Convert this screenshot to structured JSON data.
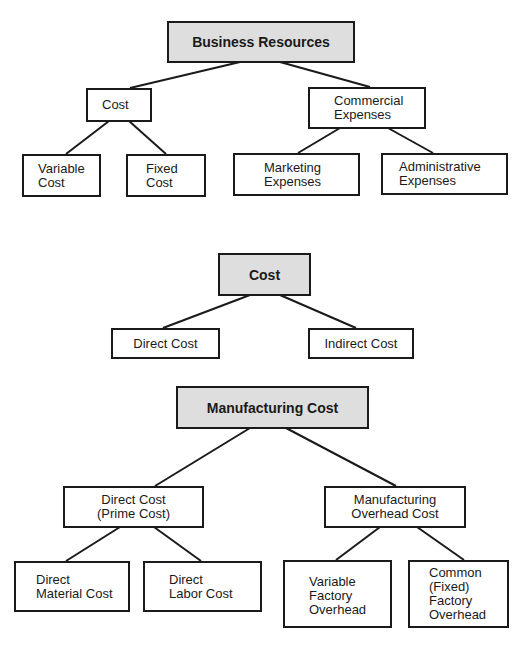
{
  "diagram1": {
    "root": "Business Resources",
    "cost": "Cost",
    "commercial": [
      "Commercial",
      "Expenses"
    ],
    "variable_cost": [
      "Variable",
      "Cost"
    ],
    "fixed_cost": [
      "Fixed",
      "Cost"
    ],
    "marketing": [
      "Marketing",
      "Expenses"
    ],
    "administrative": [
      "Administrative",
      "Expenses"
    ]
  },
  "diagram2": {
    "root": "Cost",
    "direct": "Direct Cost",
    "indirect": "Indirect Cost"
  },
  "diagram3": {
    "root": "Manufacturing Cost",
    "prime": [
      "Direct Cost",
      "(Prime Cost)"
    ],
    "overhead": [
      "Manufacturing",
      "Overhead Cost"
    ],
    "material": [
      "Direct",
      "Material Cost"
    ],
    "labor": [
      "Direct",
      "Labor Cost"
    ],
    "variable_overhead": [
      "Variable",
      "Factory",
      "Overhead"
    ],
    "common_overhead": [
      "Common",
      "(Fixed)",
      "Factory",
      "Overhead"
    ]
  },
  "colors": {
    "line": "#1a1a1a",
    "shaded_fill": "#dedede",
    "box_fill": "#ffffff"
  }
}
